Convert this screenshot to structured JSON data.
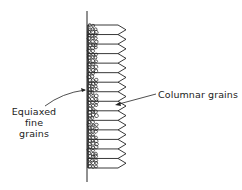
{
  "figure": {
    "labels": {
      "equiaxed": [
        "Equiaxed",
        "fine",
        "grains"
      ],
      "columnar": "Columnar grains"
    },
    "wall": {
      "x": 87,
      "y_top": 11,
      "y_bottom": 182
    },
    "columnar_zone": {
      "x_start": 95,
      "x_end": 118,
      "tip_x": 126,
      "y_top": 25,
      "y_bottom": 168,
      "grain_count": 15
    },
    "equiaxed_zone": {
      "x_start": 88,
      "x_end": 95
    },
    "colors": {
      "line": "#222222",
      "background": "#ffffff"
    }
  }
}
